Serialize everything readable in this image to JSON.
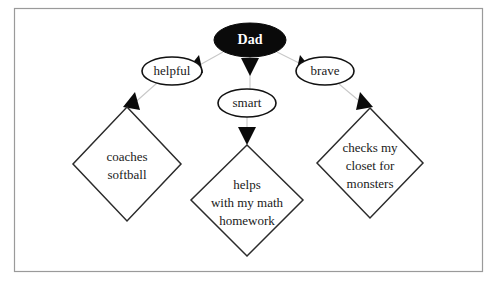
{
  "diagram": {
    "type": "concept-map",
    "title_node": {
      "id": "dad",
      "label": "Dad",
      "shape": "ellipse",
      "fill": "#0a0a0a",
      "text_color": "#ffffff"
    },
    "trait_nodes": [
      {
        "id": "helpful",
        "label": "helpful",
        "shape": "ellipse"
      },
      {
        "id": "smart",
        "label": "smart",
        "shape": "ellipse"
      },
      {
        "id": "brave",
        "label": "brave",
        "shape": "ellipse"
      }
    ],
    "detail_nodes": [
      {
        "id": "coaches-softball",
        "shape": "diamond",
        "lines": [
          "coaches",
          "softball"
        ]
      },
      {
        "id": "helps-math-homework",
        "shape": "diamond",
        "lines": [
          "helps",
          "with my math",
          "homework"
        ]
      },
      {
        "id": "checks-closet-monsters",
        "shape": "diamond",
        "lines": [
          "checks my",
          "closet for",
          "monsters"
        ]
      }
    ],
    "edges": [
      {
        "from": "dad",
        "to": "helpful"
      },
      {
        "from": "dad",
        "to": "smart"
      },
      {
        "from": "dad",
        "to": "brave"
      },
      {
        "from": "helpful",
        "to": "coaches-softball"
      },
      {
        "from": "smart",
        "to": "helps-math-homework"
      },
      {
        "from": "brave",
        "to": "checks-closet-monsters"
      }
    ],
    "colors": {
      "border": "#9a9a9a",
      "connector": "#c8c8c8",
      "arrow": "#0a0a0a",
      "outline": "#2b2b2b",
      "background": "#ffffff"
    }
  }
}
